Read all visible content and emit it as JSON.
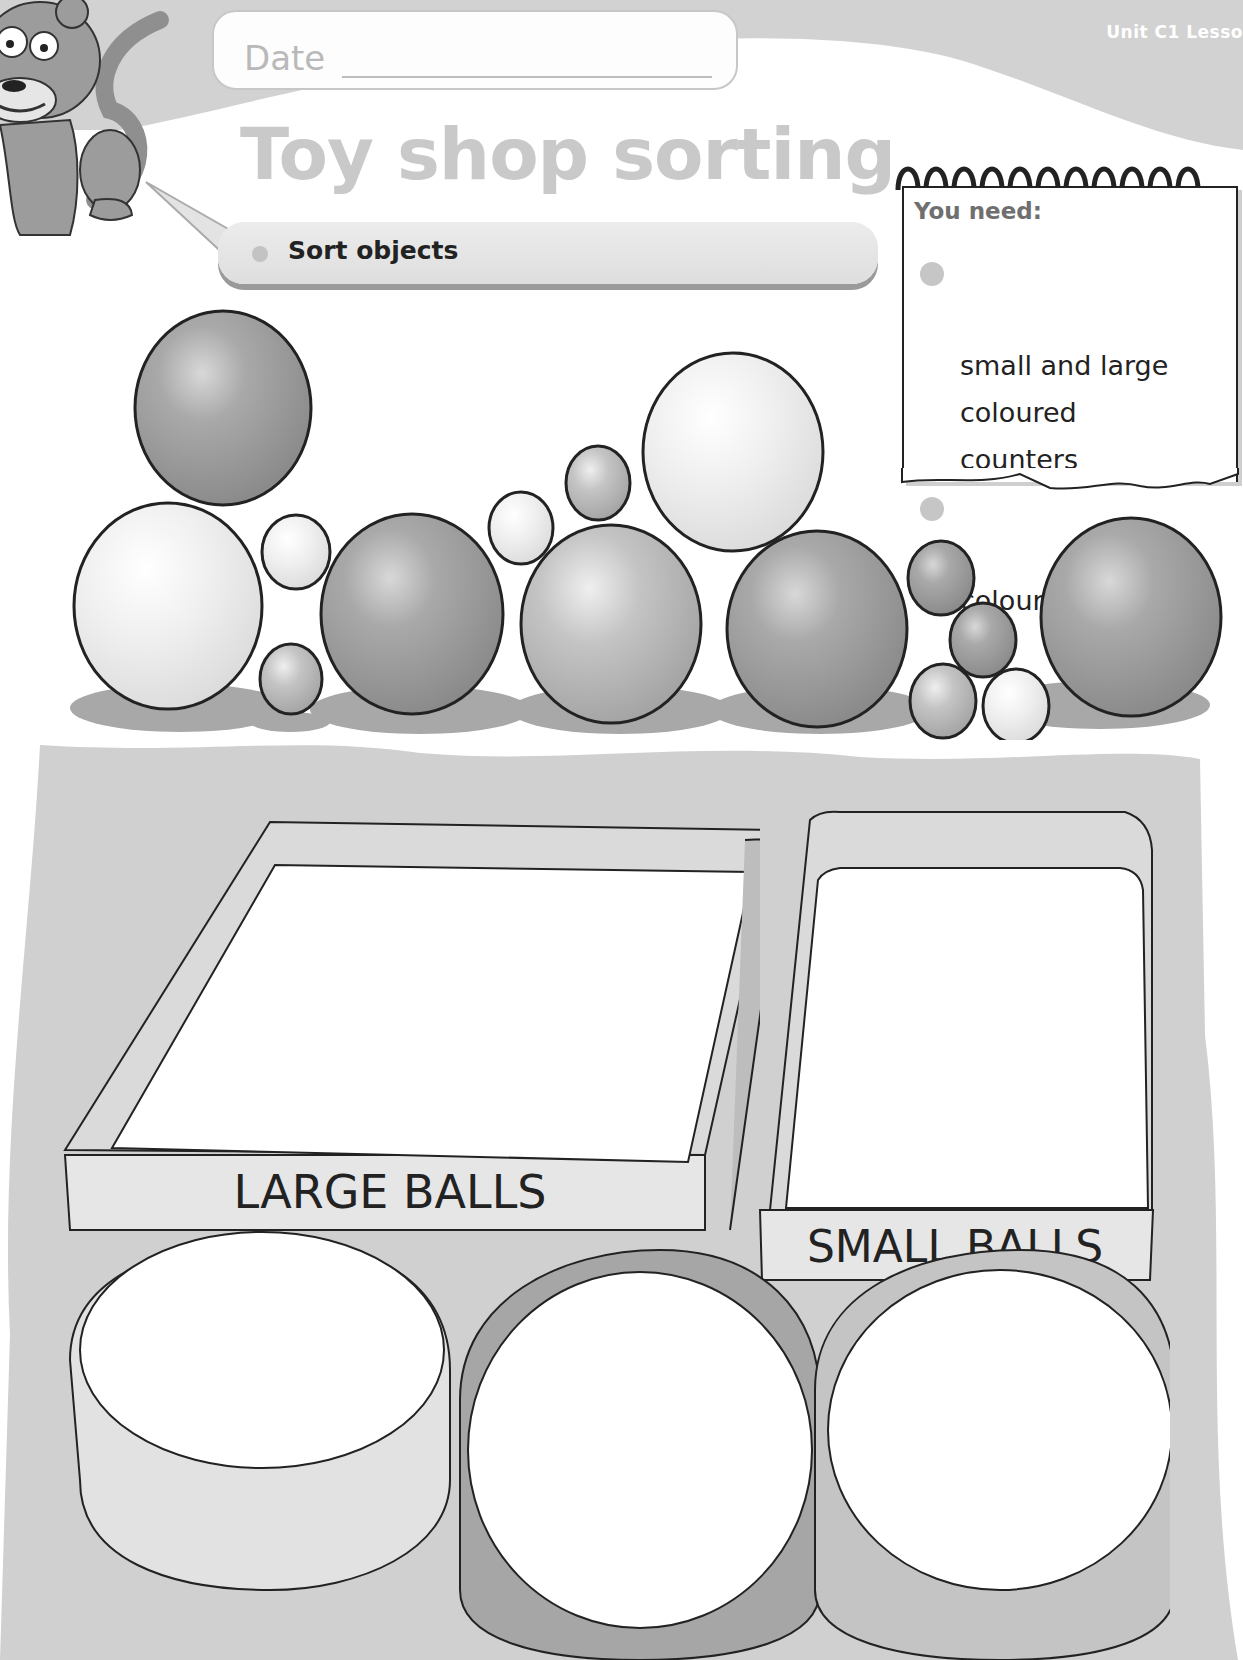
{
  "header": {
    "date_label": "Date",
    "unit_label": "Unit C1 Lesso",
    "title": "Toy shop sorting",
    "objective": "Sort objects"
  },
  "you_need": {
    "heading": "You need:",
    "items": [
      {
        "label": "small and large\ncoloured\ncounters"
      },
      {
        "label": "coloured pencils"
      }
    ]
  },
  "balls": {
    "large_count": 8,
    "small_count": 9
  },
  "sorting": {
    "large_box_label": "LARGE BALLS",
    "small_box_label": "SMALL BALLS",
    "hoops_count": 3
  },
  "colors": {
    "header_band": "#cfcfcf",
    "title": "#c9c9c9",
    "watercolor_bg": "#cfcfcf",
    "ink": "#222222"
  }
}
